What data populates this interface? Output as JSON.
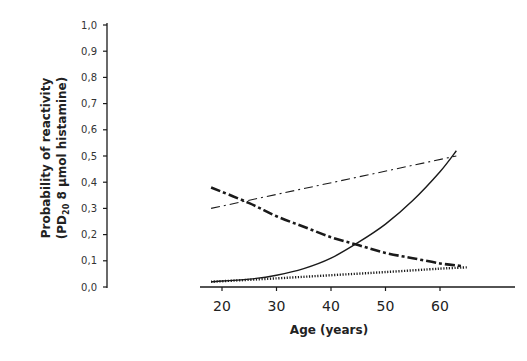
{
  "chart_data": {
    "type": "line",
    "title": "",
    "xlabel": "Age (years)",
    "ylabel_line1": "Probability of reactivity",
    "ylabel_line2_prefix": "(PD",
    "ylabel_line2_sub": "20",
    "ylabel_line2_suffix": " 8 μmol histamine)",
    "ylabel": "Probability of reactivity (PD20 8 μmol histamine)",
    "xlim": [
      10,
      76
    ],
    "ylim": [
      0.0,
      1.0
    ],
    "x_ticks": [
      20,
      30,
      40,
      50,
      60
    ],
    "x_tick_labels": [
      "20",
      "30",
      "40",
      "50",
      "60"
    ],
    "y_ticks": [
      0.0,
      0.1,
      0.2,
      0.3,
      0.4,
      0.5,
      0.6,
      0.7,
      0.8,
      0.9,
      1.0
    ],
    "y_tick_labels": [
      "0,0",
      "0,1",
      "0,2",
      "0,3",
      "0,4",
      "0,5",
      "0,6",
      "0,7",
      "0,8",
      "0,9",
      "1,0"
    ],
    "grid": false,
    "legend": null,
    "series": [
      {
        "name": "solid",
        "style": "solid",
        "x": [
          18,
          25,
          30,
          35,
          40,
          45,
          50,
          55,
          60,
          63
        ],
        "values": [
          0.02,
          0.03,
          0.045,
          0.07,
          0.11,
          0.17,
          0.24,
          0.33,
          0.44,
          0.52
        ]
      },
      {
        "name": "thin dash-dot",
        "style": "dashdot-thin",
        "x": [
          18,
          63
        ],
        "values": [
          0.3,
          0.5
        ]
      },
      {
        "name": "thick dash-dot",
        "style": "dashdot-thick",
        "x": [
          18,
          25,
          30,
          35,
          40,
          45,
          50,
          55,
          60,
          64
        ],
        "values": [
          0.38,
          0.32,
          0.27,
          0.23,
          0.19,
          0.16,
          0.13,
          0.11,
          0.09,
          0.08
        ]
      },
      {
        "name": "dotted",
        "style": "dotted",
        "x": [
          18,
          30,
          40,
          50,
          60,
          65
        ],
        "values": [
          0.02,
          0.033,
          0.045,
          0.057,
          0.07,
          0.075
        ]
      }
    ]
  },
  "colors": {
    "ink": "#1a1a1a",
    "background": "#ffffff"
  }
}
